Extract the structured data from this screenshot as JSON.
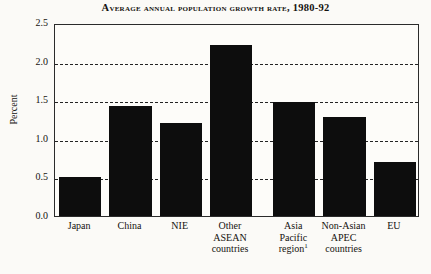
{
  "chart_data": {
    "type": "bar",
    "title": "Average annual population growth rate, 1980-92",
    "xlabel": "",
    "ylabel": "Percent",
    "ylim": [
      0.0,
      2.5
    ],
    "yticks": [
      "0.0",
      "0.5",
      "1.0",
      "1.5",
      "2.0",
      "2.5"
    ],
    "ytick_values": [
      0.0,
      0.5,
      1.0,
      1.5,
      2.0,
      2.5
    ],
    "grid": "horizontal-dashed",
    "legend": "none",
    "bar_color": "#0d0d0d",
    "categories": [
      "Japan",
      "China",
      "NIE",
      "Other ASEAN countries",
      "Asia Pacific region",
      "Non-Asian APEC countries",
      "EU"
    ],
    "category_lines": [
      [
        "Japan"
      ],
      [
        "China"
      ],
      [
        "NIE"
      ],
      [
        "Other",
        "ASEAN",
        "countries"
      ],
      [
        "Asia",
        "Pacific",
        "region"
      ],
      [
        "Non-Asian",
        "APEC",
        "countries"
      ],
      [
        "EU"
      ]
    ],
    "footnote_markers": [
      "",
      "",
      "",
      "",
      "1",
      "",
      ""
    ],
    "values": [
      0.51,
      1.42,
      1.2,
      2.21,
      1.48,
      1.28,
      0.7
    ]
  }
}
